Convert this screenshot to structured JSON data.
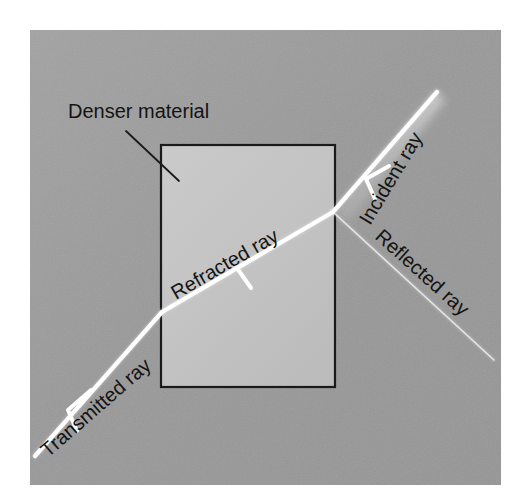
{
  "figure": {
    "canvas": {
      "width": 518,
      "height": 503,
      "page_background": "#ffffff"
    },
    "panel": {
      "name": "diagram-panel",
      "x": 30,
      "y": 30,
      "width": 471,
      "height": 455,
      "fill": "#9b9b9b",
      "fill_light": "#a6a6a6",
      "fill_dark": "#8f8f8f"
    },
    "block": {
      "name": "denser-material-block",
      "label": "Denser material",
      "x": 161,
      "y": 145,
      "width": 174,
      "height": 242,
      "fill": "#c3c3c3",
      "fill_light": "#cfcfcf",
      "stroke": "#1a1a1a",
      "stroke_width": 2.2
    },
    "leader_line": {
      "name": "denser-material-leader",
      "x1": 126,
      "y1": 131,
      "x2": 179,
      "y2": 181,
      "stroke": "#1a1a1a",
      "stroke_width": 1.8
    },
    "label_positions": {
      "denser_material": {
        "x": 68,
        "y": 118,
        "rotation": 0
      },
      "refracted_ray": {
        "x": 176,
        "y": 300,
        "rotation": -30
      },
      "incident_ray": {
        "x": 375,
        "y": 216,
        "rotation": -59
      },
      "reflected_ray": {
        "x": 376,
        "y": 236,
        "rotation": 42
      },
      "transmitted_ray": {
        "x": 48,
        "y": 455,
        "rotation": -41
      }
    },
    "rays": [
      {
        "name": "incident-ray",
        "label": "Incident ray",
        "x1": 437,
        "y1": 92,
        "x2": 333,
        "y2": 212,
        "color": "#ffffff",
        "width": 4.2,
        "glow": true,
        "arrow": {
          "x": 370,
          "y": 176,
          "angle": 131
        }
      },
      {
        "name": "refracted-ray",
        "label": "Refracted ray",
        "x1": 333,
        "y1": 212,
        "x2": 162,
        "y2": 312,
        "color": "#ffffff",
        "width": 4.2,
        "glow": false,
        "arrow": {
          "x": 243,
          "y": 266,
          "angle": 150
        }
      },
      {
        "name": "transmitted-ray",
        "label": "Transmitted ray",
        "x1": 162,
        "y1": 312,
        "x2": 35,
        "y2": 456,
        "color": "#ffffff",
        "width": 4.2,
        "glow": false,
        "arrow": {
          "x": 73,
          "y": 413,
          "angle": 131
        }
      },
      {
        "name": "reflected-ray",
        "label": "Reflected ray",
        "x1": 333,
        "y1": 212,
        "x2": 494,
        "y2": 360,
        "color": "#e2e2e2",
        "width": 1.6,
        "glow": false,
        "arrow": null
      }
    ],
    "interface_point": {
      "x": 333,
      "y": 212
    }
  }
}
